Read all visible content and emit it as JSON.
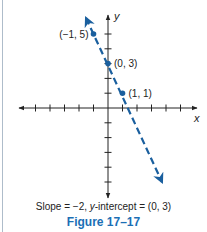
{
  "chart_data": {
    "type": "line",
    "title": "Figure 17–17",
    "caption": "Slope = −2, y-intercept = (0, 3)",
    "caption_parts": {
      "prefix": "Slope = −2, ",
      "italic": "y",
      "suffix": "-intercept = (0, 3)"
    },
    "xlabel": "x",
    "ylabel": "y",
    "xlim": [
      -6,
      6
    ],
    "ylim": [
      -6,
      6
    ],
    "grid": false,
    "line": {
      "equation": "y = -2x + 3",
      "slope": -2,
      "intercept": 3,
      "style": "dashed",
      "color": "#1a5f9e",
      "arrows": "both"
    },
    "points": [
      {
        "x": -1,
        "y": 5,
        "label": "(−1, 5)"
      },
      {
        "x": 0,
        "y": 3,
        "label": "(0, 3)"
      },
      {
        "x": 1,
        "y": 1,
        "label": "(1, 1)"
      }
    ],
    "x_ticks": [
      -5,
      -4,
      -3,
      -2,
      -1,
      1,
      2,
      3,
      4,
      5
    ],
    "y_ticks": [
      -5,
      -4,
      -3,
      -2,
      -1,
      1,
      2,
      3,
      4,
      5
    ]
  },
  "colors": {
    "line": "#1a5f9e",
    "figure_title": "#1b6fb5",
    "axis": "#222222"
  }
}
